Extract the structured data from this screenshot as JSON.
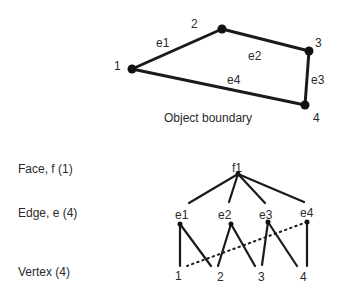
{
  "boundary": {
    "caption": "Object boundary",
    "vertices": [
      {
        "id": "1",
        "label": "1"
      },
      {
        "id": "2",
        "label": "2"
      },
      {
        "id": "3",
        "label": "3"
      },
      {
        "id": "4",
        "label": "4"
      }
    ],
    "edges": [
      {
        "id": "e1",
        "label": "e1",
        "from": "1",
        "to": "2"
      },
      {
        "id": "e2",
        "label": "e2",
        "from": "2",
        "to": "3"
      },
      {
        "id": "e3",
        "label": "e3",
        "from": "3",
        "to": "4"
      },
      {
        "id": "e4",
        "label": "e4",
        "from": "4",
        "to": "1"
      }
    ]
  },
  "hierarchy": {
    "levels": {
      "face": "Face, f (1)",
      "edge": "Edge, e (4)",
      "vertex": "Vertex (4)"
    },
    "face": {
      "label": "f1"
    },
    "edges": [
      {
        "label": "e1",
        "vertices": [
          "1",
          "2"
        ]
      },
      {
        "label": "e2",
        "vertices": [
          "2",
          "3"
        ]
      },
      {
        "label": "e3",
        "vertices": [
          "3",
          "4"
        ]
      },
      {
        "label": "e4",
        "vertices": [
          "4",
          "1"
        ],
        "style": "dotted-to-vertex-1"
      }
    ],
    "vertices": [
      {
        "label": "1"
      },
      {
        "label": "2"
      },
      {
        "label": "3"
      },
      {
        "label": "4"
      }
    ]
  }
}
